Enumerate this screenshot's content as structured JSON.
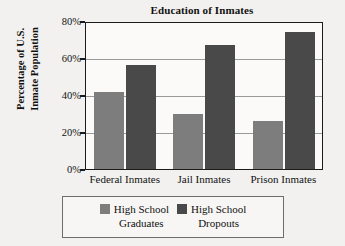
{
  "chart_data": {
    "type": "bar",
    "title": "Education of Inmates",
    "xlabel": "",
    "ylabel_lines": [
      "Percentage of U.S.",
      "Inmate Population"
    ],
    "ylabel": "Percentage of U.S. Inmate Population",
    "categories": [
      "Federal Inmates",
      "Jail Inmates",
      "Prison Inmates"
    ],
    "series": [
      {
        "name": "High School Graduates",
        "name_lines": [
          "High School",
          "Graduates"
        ],
        "color": "#7d7d7d",
        "values": [
          41.5,
          30,
          26
        ]
      },
      {
        "name": "High School Dropouts",
        "name_lines": [
          "High School",
          "Dropouts"
        ],
        "color": "#494949",
        "values": [
          56,
          67,
          74
        ]
      }
    ],
    "ylim": [
      0,
      80
    ],
    "ytick_values": [
      0,
      20,
      40,
      60,
      80
    ],
    "ytick_labels": [
      "0%",
      "20%",
      "40%",
      "60%",
      "80%"
    ],
    "grid": true,
    "grid_axis": "y",
    "legend_position": "bottom"
  },
  "style": {
    "background": "#f2f1ef",
    "plot_background": "#fbfaf8",
    "axis_color": "#1b1b1b",
    "grid_color": "#9a9a9a",
    "legend_border": "#6d6d6d"
  }
}
